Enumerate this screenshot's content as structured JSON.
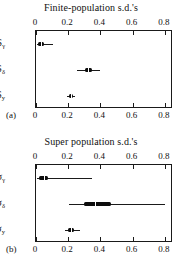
{
  "figure": {
    "width": 182,
    "height": 268,
    "background": "#ffffff",
    "ink_color": "#1a1a1a"
  },
  "panels": [
    {
      "key": "a",
      "letter": "(a)",
      "title": "Finite-population s.d.'s"
    },
    {
      "key": "b",
      "letter": "(b)",
      "title": "Super population s.d.'s"
    }
  ],
  "chart_data": [
    {
      "type": "box",
      "panel": "(a)",
      "title": "Finite-population s.d.'s",
      "xlabel": "",
      "ylabel": "",
      "xlim": [
        0,
        0.85
      ],
      "ylim": [
        0,
        3
      ],
      "grid": false,
      "legend": null,
      "axis_ticks_top": true,
      "axis_ticks_bottom": true,
      "xticks": [
        0,
        0.2,
        0.4,
        0.6,
        0.8
      ],
      "xticklabels": [
        "0",
        "0.2",
        "0.4",
        "0.6",
        "0.8"
      ],
      "categories": [
        "S_gamma",
        "S_delta",
        "S_y"
      ],
      "category_labels": [
        "S",
        "S",
        "S"
      ],
      "category_subscripts": [
        "γ",
        "δ",
        "y"
      ],
      "boxes": [
        {
          "label": "S_gamma",
          "whisker_low": 0.005,
          "q1": 0.012,
          "median": 0.03,
          "q3": 0.048,
          "whisker_high": 0.105
        },
        {
          "label": "S_delta",
          "whisker_low": 0.252,
          "q1": 0.303,
          "median": 0.323,
          "q3": 0.345,
          "whisker_high": 0.398
        },
        {
          "label": "S_y",
          "whisker_low": 0.192,
          "q1": 0.205,
          "median": 0.215,
          "q3": 0.228,
          "whisker_high": 0.245
        }
      ]
    },
    {
      "type": "box",
      "panel": "(b)",
      "title": "Super population s.d.'s",
      "xlabel": "",
      "ylabel": "",
      "xlim": [
        0,
        0.85
      ],
      "ylim": [
        0,
        3
      ],
      "grid": false,
      "legend": null,
      "axis_ticks_top": true,
      "axis_ticks_bottom": true,
      "xticks": [
        0,
        0.2,
        0.4,
        0.6,
        0.8
      ],
      "xticklabels": [
        "0",
        "0.2",
        "0.4",
        "0.6",
        "0.8"
      ],
      "categories": [
        "sigma_gamma",
        "sigma_delta",
        "sigma_y"
      ],
      "category_labels": [
        "σ",
        "σ",
        "σ"
      ],
      "category_subscripts": [
        "γ",
        "δ",
        "y"
      ],
      "boxes": [
        {
          "label": "sigma_gamma",
          "whisker_low": 0.004,
          "q1": 0.018,
          "median": 0.048,
          "q3": 0.075,
          "whisker_high": 0.345
        },
        {
          "label": "sigma_delta",
          "whisker_low": 0.205,
          "q1": 0.3,
          "median": 0.365,
          "q3": 0.465,
          "whisker_high": 0.8
        },
        {
          "label": "sigma_y",
          "whisker_low": 0.18,
          "q1": 0.2,
          "median": 0.216,
          "q3": 0.235,
          "whisker_high": 0.27
        }
      ]
    }
  ]
}
